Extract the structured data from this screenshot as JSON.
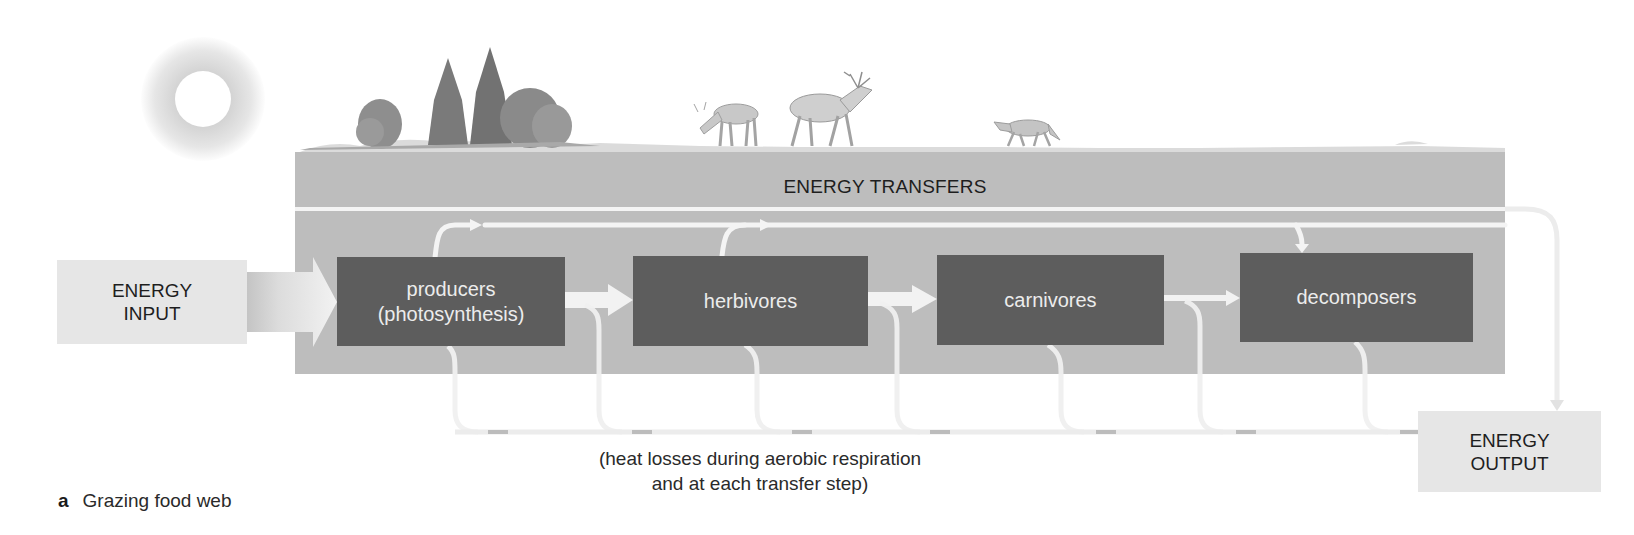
{
  "figure": {
    "label_letter": "a",
    "label_text": "Grazing food web"
  },
  "scene": {
    "icons": [
      "sun-icon",
      "trees-illustration",
      "caribou-illustration",
      "elk-illustration",
      "wolf-illustration",
      "grassland-horizon"
    ]
  },
  "panel": {
    "title": "ENERGY TRANSFERS"
  },
  "energy_input": {
    "line1": "ENERGY",
    "line2": "INPUT"
  },
  "energy_output": {
    "line1": "ENERGY",
    "line2": "OUTPUT"
  },
  "nodes": [
    {
      "line1": "producers",
      "line2": "(photosynthesis)"
    },
    {
      "line1": "herbivores",
      "line2": ""
    },
    {
      "line1": "carnivores",
      "line2": ""
    },
    {
      "line1": "decomposers",
      "line2": ""
    }
  ],
  "heat_caption": {
    "line1": "(heat losses during aerobic respiration",
    "line2": "and at each transfer step)"
  },
  "colors": {
    "panel": "#bdbdbd",
    "node": "#5d5d5d",
    "io_box": "#e6e6e6",
    "flow": "#f4f4f4"
  }
}
